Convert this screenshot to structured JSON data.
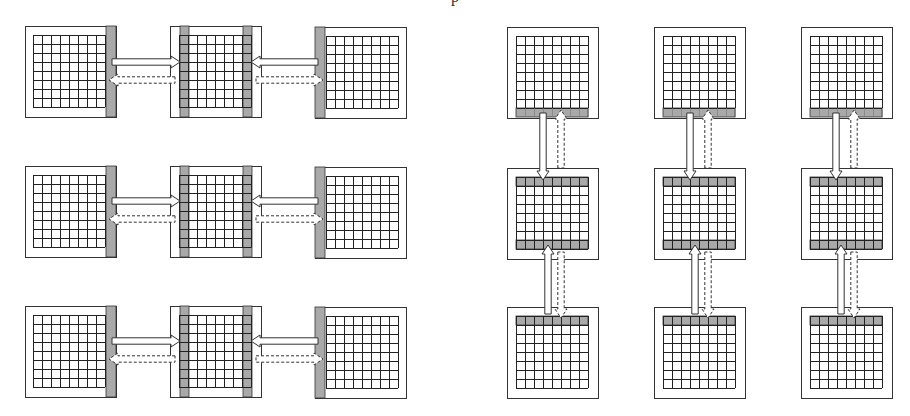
{
  "figure": {
    "top_text_fragment": "p",
    "colors": {
      "outline": "#333333",
      "grid_line": "#222222",
      "ghost_fill": "#a9a9a9",
      "background": "#ffffff",
      "arrow_fill": "#ffffff"
    },
    "grid": {
      "rows": 8,
      "cols": 8
    }
  },
  "left_panel": {
    "name": "horizontal-decomposition",
    "rows": [
      {
        "boxes": [
          {
            "x": 25,
            "y": 26,
            "ghost": [
              "right"
            ]
          },
          {
            "x": 170,
            "y": 26,
            "ghost": [
              "left",
              "right"
            ]
          },
          {
            "x": 315,
            "y": 27,
            "ghost": [
              "left"
            ]
          }
        ],
        "arrows_y": {
          "solid": 62,
          "dashed": 80
        }
      },
      {
        "boxes": [
          {
            "x": 25,
            "y": 166,
            "ghost": [
              "right"
            ]
          },
          {
            "x": 170,
            "y": 166,
            "ghost": [
              "left",
              "right"
            ]
          },
          {
            "x": 315,
            "y": 167,
            "ghost": [
              "left"
            ]
          }
        ],
        "arrows_y": {
          "solid": 201,
          "dashed": 219
        }
      },
      {
        "boxes": [
          {
            "x": 25,
            "y": 306,
            "ghost": [
              "right"
            ]
          },
          {
            "x": 170,
            "y": 306,
            "ghost": [
              "left",
              "right"
            ]
          },
          {
            "x": 315,
            "y": 307,
            "ghost": [
              "left"
            ]
          }
        ],
        "arrows_y": {
          "solid": 341,
          "dashed": 359
        }
      }
    ]
  },
  "right_panel": {
    "name": "vertical-decomposition",
    "columns": [
      {
        "boxes": [
          {
            "x": 507,
            "y": 27,
            "ghost": [
              "bottom"
            ]
          },
          {
            "x": 507,
            "y": 168,
            "ghost": [
              "top",
              "bottom"
            ]
          },
          {
            "x": 507,
            "y": 307,
            "ghost": [
              "top"
            ]
          }
        ],
        "arrows_x": {
          "solid_down": 543,
          "dashed": 561,
          "solid_up": 548
        }
      },
      {
        "boxes": [
          {
            "x": 654,
            "y": 27,
            "ghost": [
              "bottom"
            ]
          },
          {
            "x": 654,
            "y": 168,
            "ghost": [
              "top",
              "bottom"
            ]
          },
          {
            "x": 654,
            "y": 307,
            "ghost": [
              "top"
            ]
          }
        ],
        "arrows_x": {
          "solid_down": 690,
          "dashed": 708,
          "solid_up": 695
        }
      },
      {
        "boxes": [
          {
            "x": 801,
            "y": 27,
            "ghost": [
              "bottom"
            ]
          },
          {
            "x": 801,
            "y": 168,
            "ghost": [
              "top",
              "bottom"
            ]
          },
          {
            "x": 801,
            "y": 307,
            "ghost": [
              "top"
            ]
          }
        ],
        "arrows_x": {
          "solid_down": 836,
          "dashed": 854,
          "solid_up": 841
        }
      }
    ]
  }
}
